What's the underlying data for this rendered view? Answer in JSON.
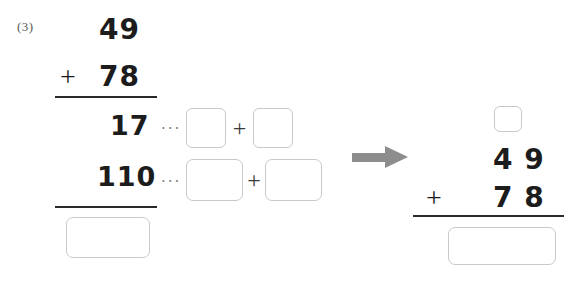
{
  "problem": {
    "number_label": "(3)",
    "type": "vertical-addition-with-partial-sums"
  },
  "left_column": {
    "addend_top": "49",
    "plus_operator": "+",
    "addend_bottom": "78",
    "partial_sum_ones": "17",
    "partial_sum_tens": "110",
    "leader_ones": "···",
    "leader_tens": "···",
    "decomposition_plus_ones": "+",
    "decomposition_plus_tens": "+",
    "blank_ones_left": "",
    "blank_ones_right": "",
    "blank_tens_left": "",
    "blank_tens_right": "",
    "blank_total": ""
  },
  "transition": {
    "arrow_icon": "right-arrow-icon",
    "arrow_color": "#8d8d8d"
  },
  "right_column": {
    "carry_box": "",
    "addend_top": "4 9",
    "plus_operator": "+",
    "addend_bottom": "7 8",
    "blank_total": ""
  },
  "theme": {
    "ink": "#1c1c1c",
    "rule": "#2b2b2b",
    "box_border": "#c9c9c9",
    "label_gray": "#5a5a5a",
    "leader_gray": "#7d7d7d",
    "page_background": "#ffffff"
  }
}
